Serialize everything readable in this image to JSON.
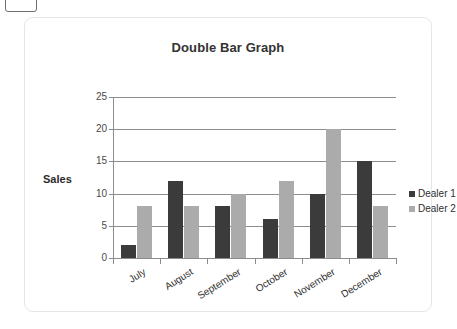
{
  "card": {
    "title": "Double Bar Graph"
  },
  "chart_data": {
    "type": "bar",
    "title": "Double Bar Graph",
    "xlabel": "",
    "ylabel": "Sales",
    "categories": [
      "July",
      "August",
      "September",
      "October",
      "November",
      "December"
    ],
    "series": [
      {
        "name": "Dealer 1",
        "color": "#3b3b3b",
        "values": [
          2,
          12,
          8,
          6,
          10,
          15
        ]
      },
      {
        "name": "Dealer 2",
        "color": "#ababab",
        "values": [
          8,
          8,
          10,
          12,
          20,
          8
        ]
      }
    ],
    "ylim": [
      0,
      25
    ],
    "yticks": [
      0,
      5,
      10,
      15,
      20,
      25
    ],
    "ytick_labels": [
      "0",
      "5",
      "10",
      "15",
      "20",
      "25"
    ],
    "grid": true,
    "grid_axis": "y",
    "legend_position": "right",
    "xtick_label_rotation": -32
  }
}
